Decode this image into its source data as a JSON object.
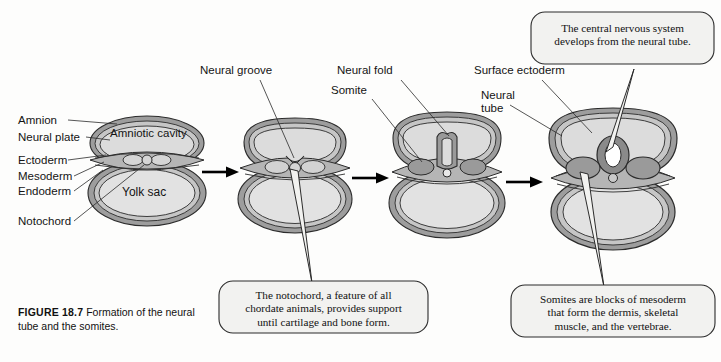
{
  "figure": {
    "caption_label": "FIGURE 18.7",
    "caption_text": "Formation of the neural tube and the somites."
  },
  "left_labels": [
    {
      "id": "amnion",
      "text": "Amnion"
    },
    {
      "id": "neural-plate",
      "text": "Neural plate"
    },
    {
      "id": "ectoderm",
      "text": "Ectoderm"
    },
    {
      "id": "mesoderm",
      "text": "Mesoderm"
    },
    {
      "id": "endoderm",
      "text": "Endoderm"
    },
    {
      "id": "notochord",
      "text": "Notochord"
    }
  ],
  "inner_labels": [
    {
      "id": "amniotic-cavity",
      "text": "Amniotic cavity"
    },
    {
      "id": "yolk-sac",
      "text": "Yolk sac"
    }
  ],
  "top_labels": [
    {
      "id": "neural-groove",
      "text": "Neural groove"
    },
    {
      "id": "neural-fold",
      "text": "Neural fold"
    },
    {
      "id": "somite",
      "text": "Somite"
    },
    {
      "id": "surface-ectoderm",
      "text": "Surface ectoderm"
    },
    {
      "id": "neural-tube-line1",
      "text": "Neural"
    },
    {
      "id": "neural-tube-line2",
      "text": "tube"
    }
  ],
  "callouts": [
    {
      "id": "cns-callout",
      "line1": "The central nervous system",
      "line2": "develops from the neural tube.",
      "line3": ""
    },
    {
      "id": "notochord-callout",
      "line1": "The notochord, a feature of all",
      "line2": "chordate animals, provides support",
      "line3": "until cartilage and bone form."
    },
    {
      "id": "somite-callout",
      "line1": "Somites are blocks of mesoderm",
      "line2": "that form the dermis, skeletal",
      "line3": "muscle, and the vertebrae."
    }
  ],
  "stages": [
    {
      "id": "stage-1",
      "name": "neural plate stage"
    },
    {
      "id": "stage-2",
      "name": "neural groove stage"
    },
    {
      "id": "stage-3",
      "name": "neural fold stage"
    },
    {
      "id": "stage-4",
      "name": "neural tube stage"
    }
  ],
  "arrows": [
    {
      "id": "arrow-1-2"
    },
    {
      "id": "arrow-2-3"
    },
    {
      "id": "arrow-3-4"
    }
  ],
  "colors": {
    "outline": "#2b2b2b",
    "membrane_dark": "#8e8e8e",
    "membrane_mid": "#a8a8a8",
    "cavity_fill": "#dcdcdc",
    "yolk_fill": "#e2e2e2",
    "somite_fill": "#9a9a9a",
    "neural_tube_lumen": "#ffffff",
    "callout_fill": "#f2f2f0",
    "background": "#fdfdfc",
    "text": "#141414"
  }
}
